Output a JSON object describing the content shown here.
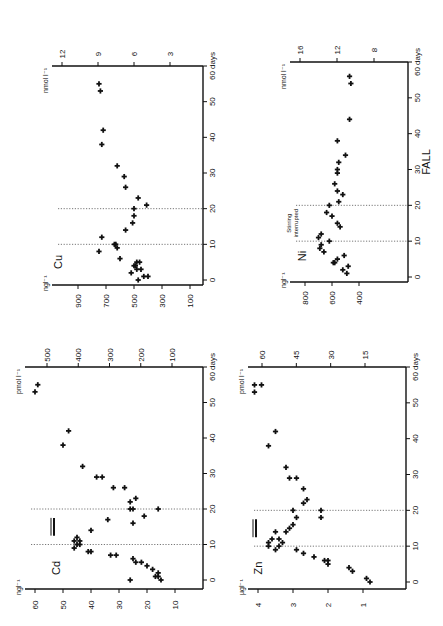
{
  "figure": {
    "orientation": "rotated-90-ccw",
    "page_label": "FALL",
    "annotation": "Stirring interrupted",
    "x_axis_unit": "days"
  },
  "chart_data": [
    {
      "type": "scatter",
      "panel": "Cu",
      "title": "Cu",
      "xlabel": "days",
      "ylabel": "ng l-1",
      "ylabel_secondary": "nmol l-1",
      "x_ticks": [
        0,
        10,
        20,
        30,
        40,
        50,
        60
      ],
      "x_tick_labels": [
        "0",
        "10",
        "20",
        "30",
        "40",
        "50",
        "60 days"
      ],
      "y_ticks": [
        100,
        300,
        500,
        700,
        900
      ],
      "y2_ticks": [
        3,
        6,
        9,
        12
      ],
      "xlim": [
        0,
        60
      ],
      "ylim": [
        0,
        1000
      ],
      "vertical_lines_days": [
        10,
        20
      ],
      "x": [
        0,
        1,
        1,
        2,
        3,
        3,
        4,
        4,
        5,
        5,
        6,
        8,
        9,
        10,
        10,
        12,
        14,
        16,
        18,
        20,
        21,
        23,
        26,
        29,
        32,
        38,
        42,
        53,
        55
      ],
      "y": [
        470,
        430,
        400,
        520,
        450,
        480,
        490,
        500,
        460,
        480,
        600,
        750,
        620,
        630,
        640,
        730,
        560,
        510,
        500,
        500,
        410,
        470,
        560,
        570,
        620,
        730,
        720,
        740,
        750
      ]
    },
    {
      "type": "scatter",
      "panel": "Ni",
      "title": "Ni",
      "xlabel": "days",
      "ylabel": "ng l-1",
      "ylabel_secondary": "nmol l-1",
      "x_ticks": [
        0,
        10,
        20,
        30,
        40,
        50,
        60
      ],
      "x_tick_labels": [
        "0",
        "10",
        "20",
        "30",
        "40",
        "50",
        "60 days"
      ],
      "y_ticks": [
        400,
        600,
        800
      ],
      "y2_ticks": [
        8,
        12,
        16
      ],
      "xlim": [
        0,
        60
      ],
      "ylim": [
        300,
        1000
      ],
      "vertical_lines_days": [
        10,
        20
      ],
      "annotation": "Stirring interrupted",
      "x": [
        1,
        2,
        3,
        4,
        4,
        5,
        6,
        7,
        8,
        9,
        10,
        11,
        12,
        14,
        15,
        17,
        18,
        20,
        21,
        23,
        24,
        26,
        29,
        30,
        32,
        34,
        38,
        44,
        54,
        56
      ],
      "y": [
        490,
        520,
        480,
        580,
        590,
        560,
        510,
        660,
        690,
        680,
        620,
        700,
        680,
        540,
        560,
        600,
        640,
        620,
        550,
        520,
        560,
        580,
        560,
        560,
        550,
        500,
        560,
        470,
        460,
        470
      ]
    },
    {
      "type": "scatter",
      "panel": "Cd",
      "title": "Cd",
      "xlabel": "days",
      "ylabel": "ng l-1",
      "ylabel_secondary": "pmol l-1",
      "x_ticks": [
        0,
        10,
        20,
        30,
        40,
        50,
        60
      ],
      "x_tick_labels": [
        "0",
        "10",
        "20",
        "30",
        "40",
        "50",
        "60 days"
      ],
      "y_ticks": [
        10,
        20,
        30,
        40,
        50,
        60
      ],
      "y2_ticks": [
        100,
        200,
        300,
        400,
        500
      ],
      "xlim": [
        0,
        60
      ],
      "ylim": [
        5,
        62
      ],
      "vertical_lines_days": [
        10,
        20
      ],
      "x": [
        0,
        0,
        1,
        1,
        2,
        3,
        4,
        5,
        5,
        6,
        7,
        7,
        8,
        8,
        9,
        10,
        10,
        11,
        11,
        12,
        14,
        16,
        17,
        18,
        20,
        20,
        20,
        22,
        23,
        26,
        26,
        29,
        29,
        32,
        38,
        42,
        53,
        55
      ],
      "y": [
        15,
        26,
        16,
        17,
        16,
        18,
        20,
        24,
        22,
        25,
        31,
        33,
        40,
        41,
        46,
        44,
        45,
        46,
        44,
        45,
        40,
        25,
        34,
        21,
        26,
        16,
        25,
        26,
        24,
        28,
        32,
        36,
        38,
        43,
        50,
        48,
        60,
        59
      ]
    },
    {
      "type": "scatter",
      "panel": "Zn",
      "title": "Zn",
      "xlabel": "days",
      "ylabel": "µg l-1",
      "ylabel_secondary": "pmol l-1",
      "x_ticks": [
        0,
        10,
        20,
        30,
        40,
        50,
        60
      ],
      "x_tick_labels": [
        "0",
        "10",
        "20",
        "30",
        "40",
        "50",
        "60 days"
      ],
      "y_ticks": [
        1.0,
        2.0,
        3.0,
        4.0
      ],
      "y2_ticks": [
        15,
        30,
        45,
        60
      ],
      "xlim": [
        0,
        60
      ],
      "ylim": [
        0.5,
        4.4
      ],
      "vertical_lines_days": [
        10,
        20
      ],
      "x": [
        0,
        1,
        3,
        4,
        5,
        6,
        6,
        7,
        8,
        9,
        9,
        10,
        10,
        11,
        11,
        12,
        12,
        14,
        14,
        15,
        16,
        18,
        18,
        20,
        20,
        22,
        23,
        26,
        29,
        29,
        32,
        38,
        42,
        53,
        55,
        55
      ],
      "y": [
        0.8,
        0.9,
        1.3,
        1.4,
        2.0,
        2.1,
        2.0,
        2.4,
        2.7,
        2.9,
        3.5,
        3.7,
        3.4,
        3.7,
        3.3,
        3.6,
        3.4,
        3.2,
        3.5,
        3.1,
        3.0,
        2.9,
        2.2,
        3.0,
        2.2,
        2.7,
        2.6,
        2.7,
        2.9,
        3.1,
        3.2,
        3.7,
        3.5,
        4.1,
        4.1,
        3.9
      ]
    }
  ]
}
